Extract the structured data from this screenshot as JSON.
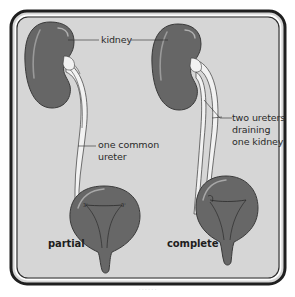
{
  "figure": {
    "panel_fill": "#d6d6d6",
    "frame_color": "#1f1f1f",
    "organ_fill": "#666666",
    "organ_outline": "#3a3a3a",
    "ureter_fill": "#f2f2f2",
    "labels": {
      "kidney": "kidney",
      "one_common": "one common",
      "ureter": "ureter",
      "two_ureters": "two ureters",
      "draining": "draining",
      "one_kidney": "one kidney",
      "partial": "partial",
      "complete": "complete"
    },
    "panels": [
      {
        "name": "partial",
        "label": "partial",
        "ureter_type": "one common ureter"
      },
      {
        "name": "complete",
        "label": "complete",
        "ureter_type": "two ureters draining one kidney"
      }
    ],
    "caption": "· · ·  ·  · ·"
  }
}
